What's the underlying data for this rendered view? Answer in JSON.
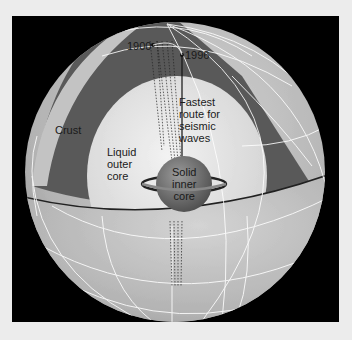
{
  "diagram": {
    "labels": {
      "year_1900": "1900",
      "year_1996": "1996",
      "crust": "Crust",
      "fastest_route": [
        "Fastest",
        "route for",
        "seismic",
        "waves"
      ],
      "liquid_outer_core": [
        "Liquid",
        "outer",
        "core"
      ],
      "solid_inner_core": [
        "Solid",
        "inner",
        "core"
      ]
    },
    "colors": {
      "background": "#ececec",
      "frame": "#000000",
      "globe_surface": "#b8b8b8",
      "mantle_cut": "#555555",
      "outer_core": "#dcdcdc",
      "inner_core": "#6a6a6a",
      "grid_lines": "#ffffff"
    }
  }
}
